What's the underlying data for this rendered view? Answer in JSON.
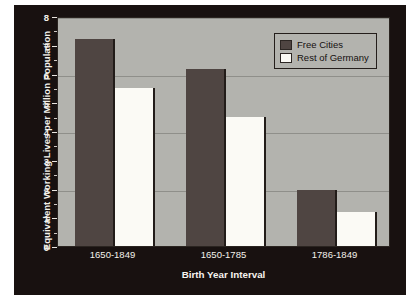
{
  "chart_data": {
    "type": "bar",
    "title": "",
    "xlabel": "Birth Year Interval",
    "ylabel": "Equivalent Working Lives per Million Population",
    "categories": [
      "1650-1849",
      "1650-1785",
      "1786-1849"
    ],
    "series": [
      {
        "name": "Free Cities",
        "values": [
          7.2,
          6.15,
          1.95
        ],
        "color": "#4f4542"
      },
      {
        "name": "Rest of Germany",
        "values": [
          5.5,
          4.5,
          1.2
        ],
        "color": "#fbfaf5"
      }
    ],
    "ylim": [
      0,
      8
    ],
    "yticks": [
      0,
      1,
      2,
      3,
      4,
      5,
      6,
      7,
      8
    ],
    "ytick_labels": [
      "0",
      "1",
      "2",
      "3",
      "4",
      "5",
      "6",
      "7",
      "8"
    ],
    "yminor_ticks": [
      0.5,
      1.5,
      2.5,
      3.5,
      4.5,
      5.5,
      6.5,
      7.5
    ],
    "gridlines": [
      2,
      4,
      6,
      8
    ],
    "grid": true,
    "legend_position": "top-right",
    "plot_background": "#b3b3ae",
    "panel_background": "#181110",
    "text_color": "#f4f1ec"
  }
}
